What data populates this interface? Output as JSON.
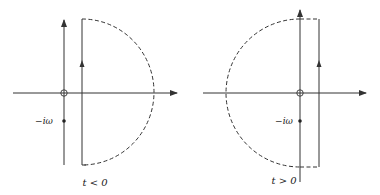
{
  "figure": {
    "panels": [
      {
        "id": "left",
        "condition_label": "t < 0",
        "point_label": "−iω",
        "contour": "closed in right half-plane (dashed semicircle right of vertical line)"
      },
      {
        "id": "right",
        "condition_label": "t > 0",
        "point_label": "−iω",
        "contour": "closed in left half-plane (dashed semicircle left of vertical line)"
      }
    ],
    "colors": {
      "line": "#333333",
      "background": "#ffffff"
    }
  }
}
